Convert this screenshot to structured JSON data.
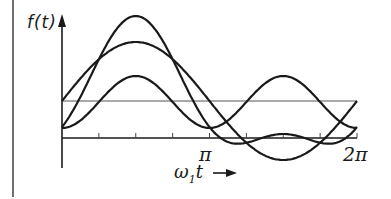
{
  "figure": {
    "y_axis_label": "f(t)",
    "x_axis_label_main": "ω",
    "x_axis_label_sub": "1",
    "x_axis_label_var": "t",
    "x_axis_arrow": "→",
    "tick_labels": {
      "pi": "π",
      "two_pi": "2π"
    },
    "colors": {
      "ink": "#1a1a1a",
      "thin": "#555555",
      "background": "#ffffff"
    }
  },
  "plot": {
    "origin_px": [
      62,
      138
    ],
    "x_end_px": 357,
    "y_top_px": 18,
    "reference_line_y_px": 101,
    "left_border_x_px": 13,
    "tick_count": 8
  },
  "curves": [
    {
      "name": "fundamental",
      "offset": 37,
      "sin_amp": 59,
      "cos2_amp": 0
    },
    {
      "name": "second-harmonic",
      "offset": 36,
      "sin_amp": 0,
      "cos2_amp": 26
    },
    {
      "name": "resultant",
      "offset": 37,
      "sin_amp": 59,
      "cos2_amp": 26
    }
  ]
}
